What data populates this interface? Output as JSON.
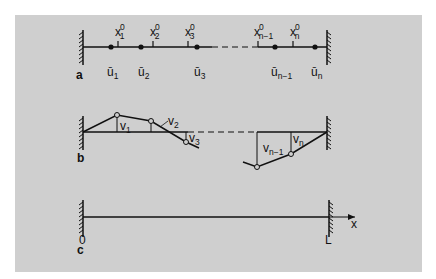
{
  "figure": {
    "background_color": "#cfcfcf",
    "line_color": "#111111",
    "panels": [
      {
        "id": "a",
        "label": "a",
        "description": "Discrete chain: nodes between fixed walls",
        "reference_positions": [
          {
            "base": "x",
            "sup": "0",
            "sub": "1"
          },
          {
            "base": "x",
            "sup": "0",
            "sub": "2"
          },
          {
            "base": "x",
            "sup": "0",
            "sub": "3"
          },
          {
            "base": "x",
            "sup": "0",
            "sub": "n−1"
          },
          {
            "base": "x",
            "sup": "0",
            "sub": "n"
          }
        ],
        "displacements": [
          {
            "base": "ū",
            "sub": "1"
          },
          {
            "base": "ū",
            "sub": "2"
          },
          {
            "base": "ū",
            "sub": "3"
          },
          {
            "base": "ū",
            "sub": "n−1"
          },
          {
            "base": "ū",
            "sub": "n"
          }
        ]
      },
      {
        "id": "b",
        "label": "b",
        "description": "Transverse displacements of chain nodes",
        "transverse": [
          {
            "base": "v",
            "sub": "1"
          },
          {
            "base": "v",
            "sub": "2"
          },
          {
            "base": "v",
            "sub": "3"
          },
          {
            "base": "v",
            "sub": "n−1"
          },
          {
            "base": "v",
            "sub": "n"
          }
        ]
      },
      {
        "id": "c",
        "label": "c",
        "description": "Continuous string between 0 and L",
        "left_end": "0",
        "right_end": "L",
        "axis_label": "x"
      }
    ]
  }
}
